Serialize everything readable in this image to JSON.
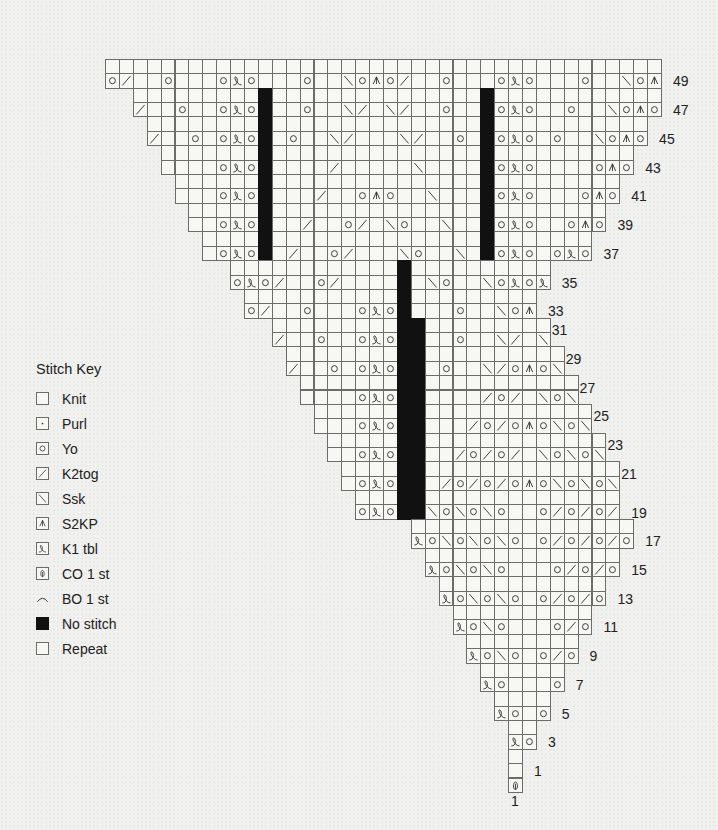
{
  "legend": {
    "title": "Stitch Key",
    "items": [
      {
        "symbol": "knit",
        "label": "Knit",
        "icon": "empty-square-icon"
      },
      {
        "symbol": "purl",
        "label": "Purl",
        "icon": "dot-square-icon"
      },
      {
        "symbol": "yo",
        "label": "Yo",
        "icon": "circle-square-icon"
      },
      {
        "symbol": "k2tog",
        "label": "K2tog",
        "icon": "right-slant-square-icon"
      },
      {
        "symbol": "ssk",
        "label": "Ssk",
        "icon": "left-slant-square-icon"
      },
      {
        "symbol": "s2kp",
        "label": "S2KP",
        "icon": "caret-square-icon"
      },
      {
        "symbol": "k1tbl",
        "label": "K1 tbl",
        "icon": "loop-square-icon"
      },
      {
        "symbol": "co",
        "label": "CO 1 st",
        "icon": "cast-on-square-icon"
      },
      {
        "symbol": "bo",
        "label": "BO 1 st",
        "icon": "arc-icon"
      },
      {
        "symbol": "nostitch",
        "label": "No stitch",
        "icon": "black-square-icon"
      },
      {
        "symbol": "repeat",
        "label": "Repeat",
        "icon": "empty-square-icon"
      }
    ]
  },
  "chart": {
    "origin_x": 105,
    "origin_y": 59,
    "cell_w": 13.9,
    "cell_h": 14.37,
    "top_row": 50,
    "symbol_codes": {
      "O": "yo",
      "L": "k1tbl",
      "/": "k2tog",
      "\\": "ssk",
      "A": "s2kp",
      "C": "co",
      "X": "nostitch"
    },
    "rows": [
      {
        "row": 50,
        "start": 0,
        "end": 39,
        "sym": {
          "11": "X",
          "27": "X"
        },
        "no_bar_top": true
      },
      {
        "row": 49,
        "start": 0,
        "end": 39,
        "label": "49",
        "sym": {
          "0": "O",
          "1": "/",
          "4": "O",
          "8": "O",
          "9": "L",
          "10": "O",
          "14": "O",
          "17": "\\",
          "18": "O",
          "19": "A",
          "20": "O",
          "21": "/",
          "24": "O",
          "28": "O",
          "29": "L",
          "30": "O",
          "34": "O",
          "37": "\\",
          "38": "O",
          "39": "A"
        }
      },
      {
        "row": 48,
        "start": 2,
        "end": 39,
        "sym": {
          "11": "X",
          "27": "X"
        }
      },
      {
        "row": 47,
        "start": 2,
        "end": 39,
        "label": "47",
        "sym": {
          "2": "/",
          "5": "O",
          "8": "O",
          "9": "L",
          "10": "O",
          "11": "X",
          "14": "O",
          "17": "\\",
          "18": "/",
          "20": "\\",
          "21": "/",
          "24": "O",
          "27": "X",
          "28": "O",
          "29": "L",
          "30": "O",
          "33": "O",
          "36": "\\",
          "37": "O",
          "38": "A",
          "39": "O"
        }
      },
      {
        "row": 46,
        "start": 3,
        "end": 38,
        "sym": {
          "11": "X",
          "27": "X"
        }
      },
      {
        "row": 45,
        "start": 3,
        "end": 38,
        "label": "45",
        "sym": {
          "3": "/",
          "6": "O",
          "8": "O",
          "9": "L",
          "10": "O",
          "11": "X",
          "13": "O",
          "16": "\\",
          "17": "/",
          "21": "\\",
          "22": "/",
          "25": "O",
          "27": "X",
          "28": "O",
          "29": "L",
          "30": "O",
          "32": "O",
          "35": "\\",
          "36": "O",
          "37": "A",
          "38": "O"
        }
      },
      {
        "row": 44,
        "start": 4,
        "end": 37,
        "sym": {
          "11": "X",
          "27": "X"
        }
      },
      {
        "row": 43,
        "start": 4,
        "end": 37,
        "label": "43",
        "sym": {
          "8": "O",
          "9": "L",
          "10": "O",
          "11": "X",
          "16": "/",
          "22": "\\",
          "27": "X",
          "28": "O",
          "29": "L",
          "30": "O",
          "35": "O",
          "36": "A",
          "37": "O"
        }
      },
      {
        "row": 42,
        "start": 5,
        "end": 36,
        "sym": {
          "11": "X",
          "27": "X"
        }
      },
      {
        "row": 41,
        "start": 5,
        "end": 36,
        "label": "41",
        "sym": {
          "8": "O",
          "9": "L",
          "10": "O",
          "11": "X",
          "15": "/",
          "18": "O",
          "19": "A",
          "20": "O",
          "23": "\\",
          "27": "X",
          "28": "O",
          "29": "L",
          "30": "O",
          "34": "O",
          "35": "A",
          "36": "O"
        }
      },
      {
        "row": 40,
        "start": 6,
        "end": 35,
        "sym": {
          "11": "X",
          "27": "X"
        }
      },
      {
        "row": 39,
        "start": 6,
        "end": 35,
        "label": "39",
        "sym": {
          "8": "O",
          "9": "L",
          "10": "O",
          "11": "X",
          "14": "/",
          "17": "O",
          "18": "/",
          "20": "\\",
          "21": "O",
          "24": "\\",
          "27": "X",
          "28": "O",
          "29": "L",
          "30": "O",
          "33": "O",
          "34": "A",
          "35": "O"
        }
      },
      {
        "row": 38,
        "start": 7,
        "end": 34,
        "sym": {
          "11": "X",
          "27": "X"
        }
      },
      {
        "row": 37,
        "start": 7,
        "end": 34,
        "label": "37",
        "sym": {
          "8": "O",
          "9": "L",
          "10": "O",
          "11": "X",
          "13": "/",
          "16": "O",
          "17": "/",
          "21": "\\",
          "22": "O",
          "25": "\\",
          "27": "X",
          "28": "O",
          "29": "L",
          "30": "O",
          "32": "O",
          "33": "L",
          "34": "O"
        }
      },
      {
        "row": 36,
        "start": 9,
        "end": 31,
        "sym": {
          "21": "X"
        }
      },
      {
        "row": 35,
        "start": 9,
        "end": 31,
        "label": "35",
        "sym": {
          "9": "O",
          "10": "L",
          "11": "O",
          "12": "/",
          "15": "O",
          "16": "/",
          "21": "X",
          "23": "\\",
          "24": "O",
          "27": "\\",
          "28": "O",
          "29": "L",
          "30": "O",
          "31": "L"
        }
      },
      {
        "row": 34,
        "start": 10,
        "end": 30,
        "sym": {
          "21": "X"
        }
      },
      {
        "row": 33,
        "start": 10,
        "end": 30,
        "label": "33",
        "sym": {
          "10": "O",
          "11": "/",
          "14": "O",
          "18": "O",
          "19": "L",
          "20": "O",
          "21": "X",
          "25": "O",
          "28": "\\",
          "29": "O",
          "30": "A"
        }
      },
      {
        "row": 32,
        "start": 12,
        "end": 31,
        "sym": {
          "21": "X",
          "22": "X"
        }
      },
      {
        "row": 31,
        "start": 12,
        "end": 31,
        "label": "31",
        "label_up": true,
        "sym": {
          "12": "/",
          "15": "O",
          "18": "O",
          "19": "L",
          "20": "O",
          "21": "X",
          "22": "X",
          "25": "O",
          "28": "\\",
          "29": "/",
          "31": "\\"
        }
      },
      {
        "row": 30,
        "start": 13,
        "end": 32,
        "sym": {
          "21": "X",
          "22": "X"
        }
      },
      {
        "row": 29,
        "start": 13,
        "end": 32,
        "label": "29",
        "label_up": true,
        "sym": {
          "13": "/",
          "16": "O",
          "18": "O",
          "19": "L",
          "20": "O",
          "21": "X",
          "22": "X",
          "24": "O",
          "27": "\\",
          "28": "/",
          "29": "O",
          "30": "A",
          "31": "O",
          "32": "\\"
        }
      },
      {
        "row": 28,
        "start": 14,
        "end": 33,
        "sym": {
          "21": "X",
          "22": "X"
        }
      },
      {
        "row": 27,
        "start": 14,
        "end": 33,
        "label": "27",
        "label_up": true,
        "sym": {
          "18": "O",
          "19": "L",
          "20": "O",
          "21": "X",
          "22": "X",
          "27": "/",
          "28": "O",
          "29": "/",
          "31": "\\",
          "32": "O",
          "33": "\\"
        }
      },
      {
        "row": 26,
        "start": 15,
        "end": 34,
        "sym": {
          "21": "X",
          "22": "X"
        }
      },
      {
        "row": 25,
        "start": 15,
        "end": 34,
        "label": "25",
        "label_up": true,
        "sym": {
          "18": "O",
          "19": "L",
          "20": "O",
          "21": "X",
          "22": "X",
          "26": "/",
          "27": "O",
          "28": "/",
          "29": "O",
          "30": "A",
          "31": "O",
          "32": "\\",
          "33": "O",
          "34": "\\"
        }
      },
      {
        "row": 24,
        "start": 16,
        "end": 35,
        "sym": {
          "21": "X",
          "22": "X"
        }
      },
      {
        "row": 23,
        "start": 16,
        "end": 35,
        "label": "23",
        "label_up": true,
        "sym": {
          "18": "O",
          "19": "L",
          "20": "O",
          "21": "X",
          "22": "X",
          "25": "/",
          "26": "O",
          "27": "/",
          "28": "O",
          "29": "/",
          "31": "\\",
          "32": "O",
          "33": "\\",
          "34": "O",
          "35": "\\"
        }
      },
      {
        "row": 22,
        "start": 17,
        "end": 36,
        "sym": {
          "21": "X",
          "22": "X"
        }
      },
      {
        "row": 21,
        "start": 17,
        "end": 36,
        "label": "21",
        "label_up": true,
        "sym": {
          "18": "O",
          "19": "L",
          "20": "O",
          "21": "X",
          "22": "X",
          "24": "/",
          "25": "O",
          "26": "/",
          "27": "O",
          "28": "/",
          "29": "O",
          "30": "A",
          "31": "O",
          "32": "\\",
          "33": "O",
          "34": "\\",
          "35": "O",
          "36": "\\"
        }
      },
      {
        "row": 20,
        "start": 18,
        "end": 36,
        "sym": {
          "21": "X",
          "22": "X"
        }
      },
      {
        "row": 19,
        "start": 18,
        "end": 36,
        "label": "19",
        "sym": {
          "18": "O",
          "19": "L",
          "20": "O",
          "21": "X",
          "22": "X",
          "23": "\\",
          "24": "O",
          "25": "\\",
          "26": "O",
          "27": "\\",
          "28": "O",
          "31": "O",
          "32": "/",
          "33": "O",
          "34": "/",
          "35": "O",
          "36": "/"
        }
      },
      {
        "row": 18,
        "start": 22,
        "end": 37,
        "sym": {}
      },
      {
        "row": 17,
        "start": 22,
        "end": 37,
        "label": "17",
        "sym": {
          "22": "L",
          "23": "O",
          "24": "\\",
          "25": "O",
          "26": "\\",
          "27": "O",
          "28": "\\",
          "29": "O",
          "31": "O",
          "32": "/",
          "33": "O",
          "34": "/",
          "35": "O",
          "36": "/",
          "37": "O"
        }
      },
      {
        "row": 16,
        "start": 23,
        "end": 36,
        "sym": {}
      },
      {
        "row": 15,
        "start": 23,
        "end": 36,
        "label": "15",
        "sym": {
          "23": "L",
          "24": "O",
          "25": "\\",
          "26": "O",
          "27": "\\",
          "28": "O",
          "32": "O",
          "33": "/",
          "34": "O",
          "35": "/",
          "36": "O"
        }
      },
      {
        "row": 14,
        "start": 24,
        "end": 35,
        "sym": {}
      },
      {
        "row": 13,
        "start": 24,
        "end": 35,
        "label": "13",
        "sym": {
          "24": "L",
          "25": "O",
          "26": "\\",
          "27": "O",
          "28": "\\",
          "29": "O",
          "31": "O",
          "32": "/",
          "33": "O",
          "34": "/",
          "35": "O"
        }
      },
      {
        "row": 12,
        "start": 25,
        "end": 34,
        "sym": {}
      },
      {
        "row": 11,
        "start": 25,
        "end": 34,
        "label": "11",
        "sym": {
          "25": "L",
          "26": "O",
          "27": "\\",
          "28": "O",
          "32": "O",
          "33": "/",
          "34": "O"
        }
      },
      {
        "row": 10,
        "start": 26,
        "end": 33,
        "sym": {}
      },
      {
        "row": 9,
        "start": 26,
        "end": 33,
        "label": "9",
        "sym": {
          "26": "L",
          "27": "O",
          "28": "\\",
          "29": "O",
          "31": "O",
          "32": "/",
          "33": "O"
        }
      },
      {
        "row": 8,
        "start": 27,
        "end": 32,
        "sym": {}
      },
      {
        "row": 7,
        "start": 27,
        "end": 32,
        "label": "7",
        "sym": {
          "27": "L",
          "28": "O",
          "32": "O"
        }
      },
      {
        "row": 6,
        "start": 28,
        "end": 31,
        "sym": {}
      },
      {
        "row": 5,
        "start": 28,
        "end": 31,
        "label": "5",
        "sym": {
          "28": "L",
          "29": "O",
          "31": "O"
        }
      },
      {
        "row": 4,
        "start": 29,
        "end": 30,
        "sym": {}
      },
      {
        "row": 3,
        "start": 29,
        "end": 30,
        "label": "3",
        "sym": {
          "29": "L",
          "30": "O"
        }
      },
      {
        "row": 2,
        "start": 29,
        "end": 29,
        "sym": {}
      },
      {
        "row": 1,
        "start": 29,
        "end": 29,
        "label": "1",
        "sym": {}
      },
      {
        "row": 0,
        "start": 29,
        "end": 29,
        "label": "1",
        "label_below": true,
        "sym": {
          "29": "C"
        }
      }
    ]
  }
}
